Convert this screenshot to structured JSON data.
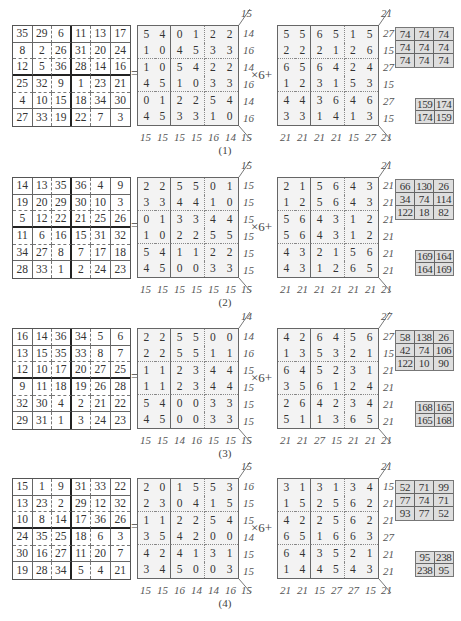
{
  "operators": {
    "equals": "=",
    "multiplier": "×6+"
  },
  "panels": [
    {
      "caption": "(1)",
      "original": [
        [
          35,
          29,
          6,
          11,
          13,
          17
        ],
        [
          8,
          2,
          26,
          31,
          20,
          24
        ],
        [
          12,
          5,
          36,
          28,
          14,
          16
        ],
        [
          25,
          32,
          9,
          1,
          23,
          21
        ],
        [
          4,
          10,
          15,
          18,
          34,
          30
        ],
        [
          27,
          33,
          19,
          22,
          7,
          3
        ]
      ],
      "quotient": {
        "grid": [
          [
            5,
            4,
            0,
            1,
            2,
            2
          ],
          [
            1,
            0,
            4,
            5,
            3,
            3
          ],
          [
            1,
            0,
            5,
            4,
            2,
            2
          ],
          [
            4,
            5,
            1,
            0,
            3,
            3
          ],
          [
            0,
            1,
            2,
            2,
            5,
            4
          ],
          [
            4,
            5,
            3,
            3,
            1,
            0
          ]
        ],
        "row_sums": [
          14,
          16,
          14,
          16,
          14,
          16
        ],
        "col_sums": [
          15,
          15,
          15,
          15,
          16,
          14
        ],
        "diag_top": "15",
        "diag_bottom": "15"
      },
      "remainder": {
        "grid": [
          [
            5,
            5,
            6,
            5,
            1,
            5
          ],
          [
            2,
            2,
            2,
            1,
            2,
            6
          ],
          [
            6,
            5,
            6,
            4,
            2,
            4
          ],
          [
            1,
            2,
            3,
            1,
            5,
            3
          ],
          [
            4,
            4,
            3,
            6,
            4,
            6
          ],
          [
            3,
            3,
            1,
            4,
            1,
            3
          ]
        ],
        "row_sums": [
          27,
          15,
          27,
          15,
          27,
          15
        ],
        "col_sums": [
          21,
          21,
          21,
          21,
          15,
          27
        ],
        "diag_top": "21",
        "diag_bottom": "21"
      },
      "sum_box_3x3": [
        [
          74,
          74,
          74
        ],
        [
          74,
          74,
          74
        ],
        [
          74,
          74,
          74
        ]
      ],
      "sum_box_2x2": [
        [
          159,
          174
        ],
        [
          174,
          159
        ]
      ]
    },
    {
      "caption": "(2)",
      "original": [
        [
          14,
          13,
          35,
          36,
          4,
          9
        ],
        [
          19,
          20,
          29,
          30,
          10,
          3
        ],
        [
          5,
          12,
          22,
          21,
          25,
          26
        ],
        [
          11,
          6,
          16,
          15,
          31,
          32
        ],
        [
          34,
          27,
          8,
          7,
          17,
          18
        ],
        [
          28,
          33,
          1,
          2,
          24,
          23
        ]
      ],
      "quotient": {
        "grid": [
          [
            2,
            2,
            5,
            5,
            0,
            1
          ],
          [
            3,
            3,
            4,
            4,
            1,
            0
          ],
          [
            0,
            1,
            3,
            3,
            4,
            4
          ],
          [
            1,
            0,
            2,
            2,
            5,
            5
          ],
          [
            5,
            4,
            1,
            1,
            2,
            2
          ],
          [
            4,
            5,
            0,
            0,
            3,
            3
          ]
        ],
        "row_sums": [
          15,
          15,
          15,
          15,
          15,
          15
        ],
        "col_sums": [
          15,
          15,
          15,
          15,
          15,
          15
        ],
        "diag_top": "15",
        "diag_bottom": "15"
      },
      "remainder": {
        "grid": [
          [
            2,
            1,
            5,
            6,
            4,
            3
          ],
          [
            1,
            2,
            5,
            6,
            4,
            3
          ],
          [
            5,
            6,
            4,
            3,
            1,
            2
          ],
          [
            5,
            6,
            4,
            3,
            1,
            2
          ],
          [
            4,
            3,
            2,
            1,
            5,
            6
          ],
          [
            4,
            3,
            1,
            2,
            6,
            5
          ]
        ],
        "row_sums": [
          21,
          21,
          21,
          21,
          21,
          21
        ],
        "col_sums": [
          21,
          21,
          21,
          21,
          21,
          21
        ],
        "diag_top": "21",
        "diag_bottom": "21"
      },
      "sum_box_3x3": [
        [
          66,
          130,
          26
        ],
        [
          34,
          74,
          114
        ],
        [
          122,
          18,
          82
        ]
      ],
      "sum_box_2x2": [
        [
          169,
          164
        ],
        [
          164,
          169
        ]
      ]
    },
    {
      "caption": "(3)",
      "original": [
        [
          16,
          14,
          36,
          34,
          5,
          6
        ],
        [
          13,
          15,
          35,
          33,
          8,
          7
        ],
        [
          12,
          10,
          17,
          20,
          27,
          25
        ],
        [
          9,
          11,
          18,
          19,
          26,
          28
        ],
        [
          32,
          30,
          4,
          2,
          21,
          22
        ],
        [
          29,
          31,
          1,
          3,
          24,
          23
        ]
      ],
      "quotient": {
        "grid": [
          [
            2,
            2,
            5,
            5,
            0,
            0
          ],
          [
            2,
            2,
            5,
            5,
            1,
            1
          ],
          [
            1,
            1,
            2,
            3,
            4,
            4
          ],
          [
            1,
            1,
            2,
            3,
            4,
            4
          ],
          [
            5,
            4,
            0,
            0,
            3,
            3
          ],
          [
            4,
            5,
            0,
            0,
            3,
            3
          ]
        ],
        "row_sums": [
          14,
          16,
          15,
          15,
          15,
          15
        ],
        "col_sums": [
          15,
          15,
          14,
          16,
          15,
          15
        ],
        "diag_top": "14",
        "diag_bottom": "15"
      },
      "remainder": {
        "grid": [
          [
            4,
            2,
            6,
            4,
            5,
            6
          ],
          [
            1,
            3,
            5,
            3,
            2,
            1
          ],
          [
            6,
            4,
            5,
            2,
            3,
            1
          ],
          [
            3,
            5,
            6,
            1,
            2,
            4
          ],
          [
            2,
            6,
            4,
            2,
            3,
            4
          ],
          [
            5,
            1,
            1,
            3,
            6,
            5
          ]
        ],
        "row_sums": [
          27,
          15,
          21,
          21,
          21,
          21
        ],
        "col_sums": [
          21,
          21,
          27,
          15,
          21,
          21
        ],
        "diag_top": "27",
        "diag_bottom": "21"
      },
      "sum_box_3x3": [
        [
          58,
          138,
          26
        ],
        [
          42,
          74,
          106
        ],
        [
          122,
          10,
          90
        ]
      ],
      "sum_box_2x2": [
        [
          168,
          165
        ],
        [
          165,
          168
        ]
      ]
    },
    {
      "caption": "(4)",
      "original": [
        [
          15,
          1,
          9,
          31,
          33,
          22
        ],
        [
          13,
          23,
          2,
          29,
          12,
          32
        ],
        [
          10,
          8,
          14,
          17,
          36,
          26
        ],
        [
          24,
          35,
          25,
          18,
          6,
          3
        ],
        [
          30,
          16,
          27,
          11,
          20,
          7
        ],
        [
          19,
          28,
          34,
          5,
          4,
          21
        ]
      ],
      "quotient": {
        "grid": [
          [
            2,
            0,
            1,
            5,
            5,
            3
          ],
          [
            2,
            3,
            0,
            4,
            1,
            5
          ],
          [
            1,
            1,
            2,
            2,
            5,
            4
          ],
          [
            3,
            5,
            4,
            2,
            0,
            0
          ],
          [
            4,
            2,
            4,
            1,
            3,
            1
          ],
          [
            3,
            4,
            5,
            0,
            0,
            3
          ]
        ],
        "row_sums": [
          16,
          15,
          15,
          14,
          15,
          15
        ],
        "col_sums": [
          15,
          15,
          16,
          14,
          14,
          16
        ],
        "diag_top": "15",
        "diag_bottom": "15"
      },
      "remainder": {
        "grid": [
          [
            3,
            1,
            3,
            1,
            3,
            4
          ],
          [
            1,
            5,
            2,
            5,
            6,
            2
          ],
          [
            4,
            2,
            2,
            5,
            6,
            2
          ],
          [
            6,
            5,
            1,
            6,
            6,
            3
          ],
          [
            6,
            4,
            3,
            5,
            2,
            1
          ],
          [
            1,
            4,
            4,
            5,
            4,
            3
          ]
        ],
        "row_sums": [
          15,
          21,
          21,
          27,
          21,
          21
        ],
        "col_sums": [
          21,
          21,
          15,
          27,
          27,
          15
        ],
        "diag_top": "21",
        "diag_bottom": "21"
      },
      "sum_box_3x3": [
        [
          52,
          71,
          99
        ],
        [
          77,
          74,
          71
        ],
        [
          93,
          77,
          52
        ]
      ],
      "sum_box_2x2": [
        [
          95,
          238
        ],
        [
          238,
          95
        ]
      ]
    }
  ]
}
